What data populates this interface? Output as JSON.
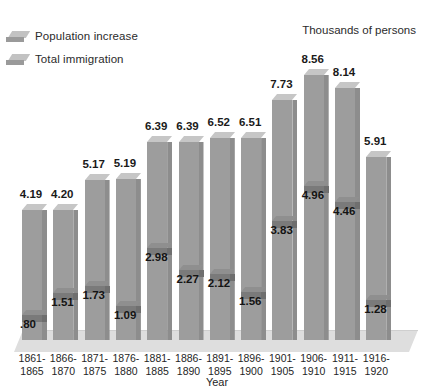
{
  "legend": {
    "items": [
      {
        "label": "Population increase",
        "swatch_name": "legend-swatch-population"
      },
      {
        "label": "Total immigration",
        "swatch_name": "legend-swatch-immigration"
      }
    ]
  },
  "unit_title": "Thousands of persons",
  "x_axis_title": "Year",
  "colors": {
    "bar_front": "#9d9d9d",
    "bar_top": "#c6c6c6",
    "bar_side": "#8d8d8d",
    "immigration_front": "#7a7a7a",
    "immigration_top": "#8f8f8f",
    "floor": "#dedede",
    "text": "#1a1a1a",
    "background": "#ffffff"
  },
  "chart_data": {
    "type": "bar",
    "title": "",
    "subtitle": "",
    "xlabel": "Year",
    "ylabel": "Thousands of persons",
    "ylim": [
      0,
      9
    ],
    "grid": false,
    "legend_position": "top-left",
    "categories": [
      "1861-1865",
      "1866-1870",
      "1871-1875",
      "1876-1880",
      "1881-1885",
      "1886-1890",
      "1891-1895",
      "1896-1900",
      "1901-1905",
      "1906-1910",
      "1911-1915",
      "1916-1920"
    ],
    "category_lines": [
      [
        "1861-",
        "1865"
      ],
      [
        "1866-",
        "1870"
      ],
      [
        "1871-",
        "1875"
      ],
      [
        "1876-",
        "1880"
      ],
      [
        "1881-",
        "1885"
      ],
      [
        "1886-",
        "1890"
      ],
      [
        "1891-",
        "1895"
      ],
      [
        "1896-",
        "1900"
      ],
      [
        "1901-",
        "1905"
      ],
      [
        "1906-",
        "1910"
      ],
      [
        "1911-",
        "1915"
      ],
      [
        "1916-",
        "1920"
      ]
    ],
    "series": [
      {
        "name": "Population increase",
        "values": [
          4.19,
          4.2,
          5.17,
          5.19,
          6.39,
          6.39,
          6.52,
          6.51,
          7.73,
          8.56,
          8.14,
          5.91
        ],
        "labels": [
          "4.19",
          "4.20",
          "5.17",
          "5.19",
          "6.39",
          "6.39",
          "6.52",
          "6.51",
          "7.73",
          "8.56",
          "8.14",
          "5.91"
        ]
      },
      {
        "name": "Total immigration",
        "values": [
          0.8,
          1.51,
          1.73,
          1.09,
          2.98,
          2.27,
          2.12,
          1.56,
          3.83,
          4.96,
          4.46,
          1.28
        ],
        "labels": [
          ".80",
          "1.51",
          "1.73",
          "1.09",
          "2.98",
          "2.27",
          "2.12",
          "1.56",
          "3.83",
          "4.96",
          "4.46",
          "1.28"
        ]
      }
    ]
  }
}
